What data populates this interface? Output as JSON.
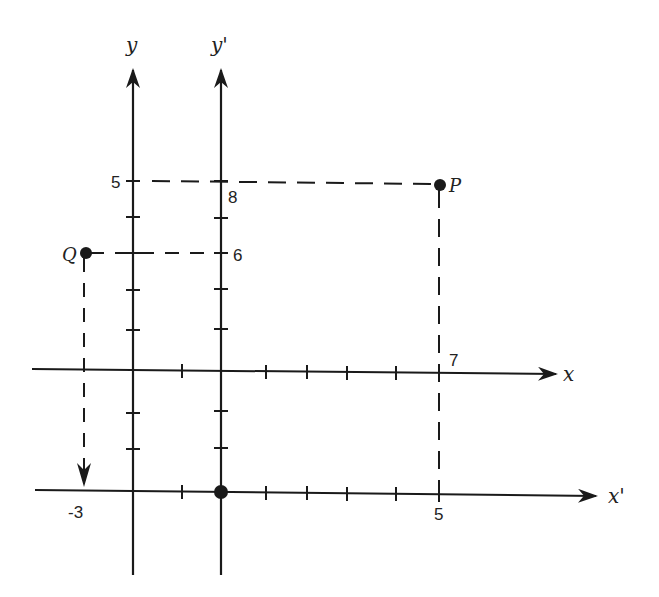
{
  "diagram": {
    "ink_color": "#1a1a1a",
    "background": "#ffffff",
    "axes": {
      "x": {
        "label": "x",
        "origin_px": [
          133,
          370
        ],
        "end_px": 558
      },
      "y": {
        "label": "y",
        "origin_px": [
          133,
          370
        ],
        "top_px": 68
      },
      "x_prime": {
        "label": "x'",
        "origin_px": [
          221,
          491
        ],
        "end_px": 598
      },
      "y_prime": {
        "label": "y'",
        "origin_px": [
          221,
          491
        ],
        "top_px": 68
      }
    },
    "points": {
      "P": {
        "label": "P",
        "xy": [
          7,
          5
        ],
        "x_prime_y_prime": [
          5,
          8
        ]
      },
      "Q": {
        "label": "Q",
        "xy": [
          -1,
          3
        ],
        "x_prime_y_prime": [
          -3,
          6
        ]
      },
      "new_origin": {
        "label": "O'",
        "xy": [
          2,
          -3
        ]
      }
    },
    "tick_labels": {
      "y_5": "5",
      "yprime_8": "8",
      "yprime_6": "6",
      "x_7": "7",
      "xprime_5": "5",
      "xprime_neg3": "-3"
    }
  }
}
